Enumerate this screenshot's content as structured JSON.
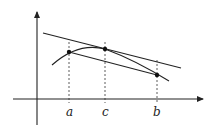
{
  "diagram": {
    "colors": {
      "stroke": "#222222",
      "background": "#ffffff"
    },
    "labels": {
      "a": "a",
      "c": "c",
      "b": "b"
    },
    "points": {
      "a": {
        "x": 69,
        "y": 52
      },
      "c": {
        "x": 105,
        "y": 49
      },
      "b": {
        "x": 157,
        "y": 75
      }
    },
    "elements": [
      "x-axis",
      "y-axis",
      "curve f(x)",
      "secant line through a and b",
      "tangent line at c parallel to secant",
      "dashed vertical guides at a, c, b"
    ]
  }
}
